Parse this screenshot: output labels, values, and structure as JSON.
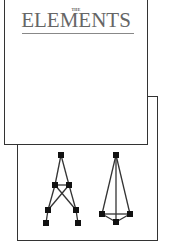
{
  "cover": {
    "prefix": "THE",
    "title": "ELEMENTS"
  },
  "figures": [
    {
      "name": "graph-a-shape",
      "nodes": 7
    },
    {
      "name": "graph-triangle-shape",
      "nodes": 4
    }
  ],
  "colors": {
    "line": "#333333",
    "title": "#666666",
    "background": "#ffffff"
  }
}
